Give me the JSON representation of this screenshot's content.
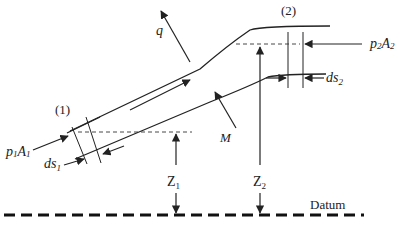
{
  "diagram": {
    "labels": {
      "section1": "(1)",
      "section2": "(2)",
      "q": "q",
      "M": "M",
      "p1A1_p": "p",
      "p1A1_sub1": "1",
      "p1A1_A": "A",
      "p1A1_sub2": "1",
      "p2A2_p": "p",
      "p2A2_sub1": "2",
      "p2A2_A": "A",
      "p2A2_sub2": "2",
      "ds1": "ds",
      "ds1_sub": "1",
      "ds2": "ds",
      "ds2_sub": "2",
      "Z1": "Z",
      "Z1_sub": "1",
      "Z2": "Z",
      "Z2_sub": "2",
      "datum": "Datum"
    },
    "colors": {
      "line": "#222222",
      "background": "#ffffff"
    }
  }
}
